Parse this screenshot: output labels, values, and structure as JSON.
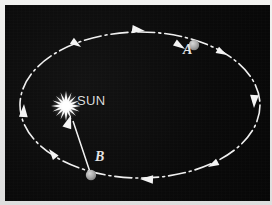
{
  "figure": {
    "width": 272,
    "height": 205,
    "background_color": "#0a0a0a",
    "border_color": "#e8e8e6",
    "stroke_color": "#f0f0f0"
  },
  "sun": {
    "label": "SUN",
    "icon": "sunburst-icon",
    "x": 61,
    "y": 101,
    "ray_count": 16,
    "color": "#ffffff"
  },
  "orbit": {
    "shape": "ellipse",
    "center_x": 135,
    "center_y": 100,
    "radius_x": 120,
    "radius_y": 73,
    "line_style": "dash-dot",
    "color": "#f0f0f0",
    "direction": "counterclockwise"
  },
  "bodies": [
    {
      "id": "A",
      "label": "A",
      "x": 189,
      "y": 40,
      "radius": 5,
      "color": "#a8a8a8",
      "label_x": 178,
      "label_y": 38
    },
    {
      "id": "B",
      "label": "B",
      "x": 86,
      "y": 170,
      "radius": 5,
      "color": "#a8a8a8",
      "label_x": 90,
      "label_y": 145
    }
  ],
  "vectors": [
    {
      "name": "radius-vector-b-to-sun",
      "from_x": 86,
      "from_y": 170,
      "to_x": 66,
      "to_y": 111,
      "color": "#f2f2f2"
    },
    {
      "name": "velocity-vector-a",
      "from_x": 192,
      "from_y": 50,
      "to_x": 180,
      "to_y": 42,
      "color": "#f2f2f2"
    }
  ],
  "direction_arrows": [
    {
      "name": "arrow-top",
      "x": 140,
      "y": 26,
      "angle": 188
    },
    {
      "name": "arrow-top-left",
      "x": 76,
      "y": 42,
      "angle": 214
    },
    {
      "name": "arrow-left",
      "x": 19,
      "y": 99,
      "angle": 93
    },
    {
      "name": "arrow-bottom-left",
      "x": 44,
      "y": 144,
      "angle": 52
    },
    {
      "name": "arrow-bottom",
      "x": 135,
      "y": 174,
      "angle": 2
    },
    {
      "name": "arrow-bottom-right",
      "x": 203,
      "y": 162,
      "angle": 332
    },
    {
      "name": "arrow-right",
      "x": 249,
      "y": 103,
      "angle": 272
    },
    {
      "name": "arrow-top-right",
      "x": 222,
      "y": 50,
      "angle": 208
    }
  ]
}
